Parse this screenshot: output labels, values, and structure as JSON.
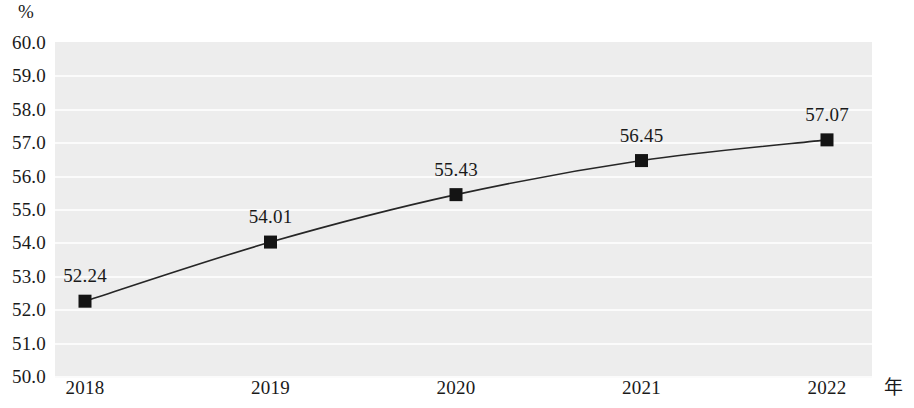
{
  "chart_data": {
    "type": "line",
    "title": "",
    "xlabel": "年",
    "ylabel": "%",
    "categories": [
      "2018",
      "2019",
      "2020",
      "2021",
      "2022"
    ],
    "values": [
      52.24,
      54.01,
      55.43,
      56.45,
      57.07
    ],
    "data_labels": [
      "52.24",
      "54.01",
      "55.43",
      "56.45",
      "57.07"
    ],
    "series": [
      {
        "name": "",
        "values": [
          52.24,
          54.01,
          55.43,
          56.45,
          57.07
        ]
      }
    ],
    "ylim": [
      50.0,
      60.0
    ],
    "ytick_step": 1.0,
    "ytick_labels": [
      "60.0",
      "59.0",
      "58.0",
      "57.0",
      "56.0",
      "55.0",
      "54.0",
      "53.0",
      "52.0",
      "51.0",
      "50.0"
    ],
    "ytick_values": [
      60.0,
      59.0,
      58.0,
      57.0,
      56.0,
      55.0,
      54.0,
      53.0,
      52.0,
      51.0,
      50.0
    ],
    "grid": true,
    "grid_orientation": "horizontal",
    "legend": false,
    "legend_position": "none",
    "marker": "square",
    "marker_color": "#141414",
    "line_color": "#262626",
    "plot_background": "#ededed",
    "gridline_color": "#fbfbfb",
    "page_background": "#ffffff",
    "text_color": "#1a1a1a"
  }
}
